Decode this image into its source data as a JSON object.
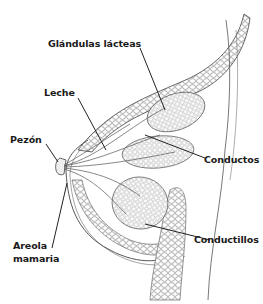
{
  "diagram": {
    "labels": [
      {
        "id": "glandulas",
        "text": "Glándulas lácteas"
      },
      {
        "id": "leche",
        "text": "Leche"
      },
      {
        "id": "pezon",
        "text": "Pezón"
      },
      {
        "id": "conductos",
        "text": "Conductos"
      },
      {
        "id": "areola_line1",
        "text": "Areola"
      },
      {
        "id": "areola_line2",
        "text": "mamaria"
      },
      {
        "id": "conductillos",
        "text": "Conductillos"
      }
    ],
    "colors": {
      "background": "#ffffff",
      "line": "#333333",
      "label_text": "#1a1a1a"
    }
  }
}
